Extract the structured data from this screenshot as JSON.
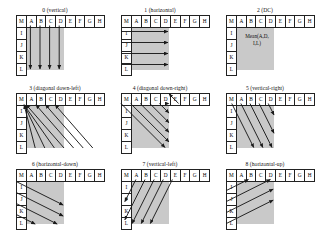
{
  "figure": {
    "columns_header": [
      "M",
      "A",
      "B",
      "C",
      "D",
      "E",
      "F",
      "G",
      "H"
    ],
    "row_labels": [
      "M",
      "I",
      "J",
      "K",
      "L"
    ],
    "shaded_columns": [
      "A",
      "B",
      "C",
      "D"
    ],
    "shaded_rows": [
      "I",
      "J",
      "K",
      "L"
    ],
    "shade_color": "#c9c9c9",
    "line_color": "#1a1a1a",
    "background": "#ffffff"
  },
  "panels": [
    {
      "id": "0",
      "title": "0 (vertical)",
      "mode_number": "0",
      "mode_name": "vertical",
      "arrow_style": "vertical-down",
      "arrow_count": 4
    },
    {
      "id": "1",
      "title": "1 (horizontal)",
      "mode_number": "1",
      "mode_name": "horizontal",
      "arrow_style": "horizontal-right",
      "arrow_count": 4
    },
    {
      "id": "2",
      "title": "2 (DC)",
      "mode_number": "2",
      "mode_name": "DC",
      "arrow_style": "none",
      "arrow_count": 0,
      "label_line1": "Mean(A,D,",
      "label_line2": "I,L)"
    },
    {
      "id": "3",
      "title": "3 (diagonal down-left)",
      "mode_number": "3",
      "mode_name": "diagonal down-left",
      "arrow_style": "diagonal-up-left",
      "arrow_count": 7
    },
    {
      "id": "4",
      "title": "4 (diagonal down-right)",
      "mode_number": "4",
      "mode_name": "diagonal down-right",
      "arrow_style": "diagonal-down-right",
      "arrow_count": 7
    },
    {
      "id": "5",
      "title": "5 (vertical-right)",
      "mode_number": "5",
      "mode_name": "vertical-right",
      "arrow_style": "steep-down-right",
      "arrow_count": 5
    },
    {
      "id": "6",
      "title": "6 (horizontal-down)",
      "mode_number": "6",
      "mode_name": "horizontal-down",
      "arrow_style": "shallow-down-right",
      "arrow_count": 4
    },
    {
      "id": "7",
      "title": "7 (vertical-left)",
      "mode_number": "7",
      "mode_name": "vertical-left",
      "arrow_style": "steep-down-left",
      "arrow_count": 5
    },
    {
      "id": "8",
      "title": "8 (horizontal-up)",
      "mode_number": "8",
      "mode_name": "horizontal-up",
      "arrow_style": "shallow-up-right",
      "arrow_count": 4
    }
  ]
}
